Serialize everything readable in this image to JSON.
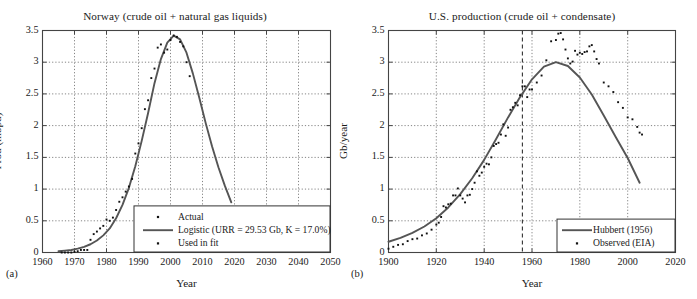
{
  "figure": {
    "width": 697,
    "height": 299,
    "background": "#ffffff",
    "line_color": "#555555",
    "marker_color": "#111111",
    "grid_color": "#777777",
    "axis_color": "#444444"
  },
  "panels": [
    {
      "tag": "(a)",
      "title": "Norway (crude oil + natural gas liquids)",
      "xlabel": "Year",
      "ylabel": "Prod (mbpd)"
    },
    {
      "tag": "(b)",
      "title": "U.S. production (crude oil + condensate)",
      "xlabel": "Year",
      "ylabel": "Gb/year"
    }
  ],
  "chart_data": [
    {
      "type": "line",
      "panel": "a",
      "title": "Norway (crude oil + natural gas liquids)",
      "xlabel": "Year",
      "ylabel": "Prod (mbpd)",
      "xlim": [
        1960,
        2050
      ],
      "ylim": [
        0,
        3.5
      ],
      "xticks": [
        1960,
        1970,
        1980,
        1990,
        2000,
        2010,
        2020,
        2030,
        2040,
        2050
      ],
      "yticks": [
        0,
        0.5,
        1,
        1.5,
        2,
        2.5,
        3,
        3.5
      ],
      "grid": true,
      "grid_style": "dotted",
      "legend_position": "lower-right",
      "legend": [
        {
          "label": "Actual",
          "marker": "dot"
        },
        {
          "label": "Logistic (URR = 29.53 Gb, K = 17.0%)",
          "marker": "line"
        },
        {
          "label": "Used in fit",
          "marker": "dot"
        }
      ],
      "series": [
        {
          "name": "Logistic (URR = 29.53 Gb, K = 17.0%)",
          "type": "line",
          "x": [
            1965,
            1967,
            1969,
            1971,
            1973,
            1975,
            1977,
            1979,
            1981,
            1983,
            1985,
            1987,
            1989,
            1991,
            1993,
            1995,
            1997,
            1999,
            2001,
            2003,
            2005,
            2007,
            2009,
            2011,
            2013,
            2015,
            2017,
            2019
          ],
          "y": [
            0.02,
            0.03,
            0.04,
            0.06,
            0.09,
            0.13,
            0.19,
            0.27,
            0.38,
            0.54,
            0.75,
            1.02,
            1.36,
            1.76,
            2.2,
            2.67,
            3.05,
            3.31,
            3.42,
            3.36,
            3.15,
            2.82,
            2.44,
            2.04,
            1.67,
            1.34,
            1.05,
            0.79
          ]
        },
        {
          "name": "Actual",
          "type": "scatter",
          "x": [
            1966,
            1967,
            1968,
            1969,
            1970,
            1971,
            1972,
            1973,
            1974,
            1975,
            1976,
            1977,
            1978,
            1979,
            1980,
            1981,
            1982,
            1983,
            1984,
            1985,
            1986,
            1987,
            1988,
            1989,
            1990,
            1991,
            1992,
            1993,
            1994,
            1995,
            1996,
            1997,
            1998,
            1999,
            2000,
            2001,
            2002,
            2003,
            2004,
            2005,
            2006
          ],
          "y": [
            0.0,
            0.0,
            0.0,
            0.0,
            0.01,
            0.02,
            0.04,
            0.04,
            0.04,
            0.2,
            0.29,
            0.33,
            0.38,
            0.42,
            0.52,
            0.5,
            0.55,
            0.67,
            0.8,
            0.87,
            0.96,
            1.04,
            1.16,
            1.56,
            1.72,
            1.96,
            2.26,
            2.4,
            2.75,
            2.9,
            3.23,
            3.28,
            3.15,
            3.2,
            3.35,
            3.42,
            3.4,
            3.32,
            3.25,
            3.0,
            2.78
          ]
        }
      ],
      "annotations": {
        "fit_parameters": {
          "URR_Gb": 29.53,
          "K_percent": 17.0
        },
        "peak": {
          "year": 2001,
          "value": 3.42
        }
      }
    },
    {
      "type": "line",
      "panel": "b",
      "title": "U.S. production (crude oil + condensate)",
      "xlabel": "Year",
      "ylabel": "Gb/year",
      "xlim": [
        1900,
        2020
      ],
      "ylim": [
        0,
        3.5
      ],
      "xticks": [
        1900,
        1920,
        1940,
        1960,
        1980,
        2000,
        2020
      ],
      "yticks": [
        0,
        0.5,
        1,
        1.5,
        2,
        2.5,
        3,
        3.5
      ],
      "grid": true,
      "grid_style": "dotted",
      "legend_position": "lower-right",
      "legend": [
        {
          "label": "Hubbert (1956)",
          "marker": "line"
        },
        {
          "label": "Observed (EIA)",
          "marker": "dot"
        }
      ],
      "vertical_marker": {
        "year": 1956,
        "style": "dashed",
        "label": "Hubbert prediction year"
      },
      "series": [
        {
          "name": "Hubbert (1956)",
          "type": "line",
          "x": [
            1900,
            1905,
            1910,
            1915,
            1920,
            1925,
            1930,
            1935,
            1940,
            1945,
            1950,
            1955,
            1960,
            1965,
            1970,
            1975,
            1980,
            1985,
            1990,
            1995,
            2000,
            2005
          ],
          "y": [
            0.17,
            0.23,
            0.31,
            0.41,
            0.54,
            0.71,
            0.92,
            1.17,
            1.46,
            1.79,
            2.13,
            2.45,
            2.73,
            2.93,
            3.0,
            2.94,
            2.76,
            2.49,
            2.16,
            1.82,
            1.49,
            1.1
          ]
        },
        {
          "name": "Observed (EIA)",
          "type": "scatter",
          "x": [
            1900,
            1902,
            1904,
            1906,
            1908,
            1910,
            1912,
            1914,
            1916,
            1918,
            1920,
            1921,
            1922,
            1923,
            1924,
            1925,
            1926,
            1927,
            1928,
            1929,
            1930,
            1931,
            1932,
            1933,
            1934,
            1935,
            1936,
            1937,
            1938,
            1939,
            1940,
            1941,
            1942,
            1943,
            1944,
            1945,
            1946,
            1947,
            1948,
            1949,
            1950,
            1951,
            1952,
            1953,
            1954,
            1955,
            1956,
            1957,
            1958,
            1959,
            1960,
            1962,
            1964,
            1966,
            1968,
            1970,
            1971,
            1972,
            1973,
            1974,
            1975,
            1976,
            1977,
            1978,
            1979,
            1980,
            1981,
            1982,
            1983,
            1984,
            1985,
            1986,
            1987,
            1988,
            1990,
            1992,
            1994,
            1996,
            1998,
            2000,
            2002,
            2004,
            2005,
            2006
          ],
          "y": [
            0.06,
            0.09,
            0.12,
            0.13,
            0.18,
            0.21,
            0.22,
            0.27,
            0.3,
            0.36,
            0.44,
            0.47,
            0.56,
            0.73,
            0.71,
            0.76,
            0.77,
            0.9,
            0.9,
            1.01,
            0.9,
            0.85,
            0.79,
            0.9,
            0.91,
            1.0,
            1.1,
            1.28,
            1.21,
            1.26,
            1.35,
            1.4,
            1.39,
            1.5,
            1.68,
            1.71,
            1.73,
            1.86,
            2.02,
            1.84,
            1.97,
            2.25,
            2.29,
            2.36,
            2.32,
            2.48,
            2.62,
            2.62,
            2.45,
            2.57,
            2.57,
            2.68,
            2.79,
            3.03,
            3.33,
            3.35,
            3.45,
            3.46,
            3.36,
            3.2,
            3.06,
            2.98,
            3.01,
            3.18,
            3.12,
            3.15,
            3.13,
            3.16,
            3.17,
            3.25,
            3.27,
            3.17,
            3.05,
            2.98,
            2.68,
            2.62,
            2.53,
            2.37,
            2.28,
            2.13,
            2.1,
            1.98,
            1.89,
            1.86
          ]
        }
      ],
      "annotations": {
        "hubbert_peak": {
          "year": 1970,
          "value": 3.0
        },
        "observed_peak": {
          "year": 1972,
          "value": 3.46
        }
      }
    }
  ]
}
